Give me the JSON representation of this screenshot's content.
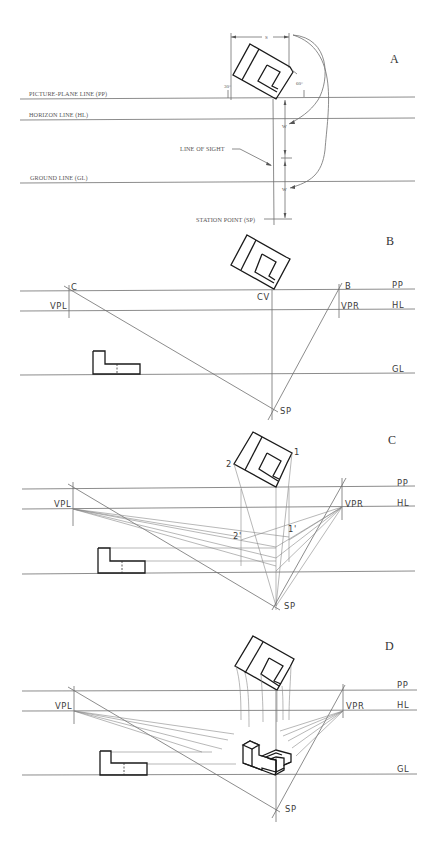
{
  "figure": {
    "panels": [
      {
        "id": "A",
        "label": "A",
        "line_labels": {
          "pp": "PICTURE-PLANE LINE (PP)",
          "hl": "HORIZON LINE (HL)",
          "gl": "GROUND LINE (GL)",
          "sp": "STATION POINT (SP)",
          "los": "LINE OF SIGHT"
        },
        "dimensions": {
          "width": "S",
          "distance_1": "W",
          "distance_2": "W"
        },
        "angles": {
          "left": "30°",
          "right": "60°"
        }
      },
      {
        "id": "B",
        "label": "B",
        "point_labels": {
          "c": "C",
          "b": "B",
          "cv": "CV",
          "vpl": "VPL",
          "vpr": "VPR",
          "sp": "SP"
        },
        "line_labels": {
          "pp": "PP",
          "hl": "HL",
          "gl": "GL"
        }
      },
      {
        "id": "C",
        "label": "C",
        "point_labels": {
          "p1": "1",
          "p2": "2",
          "p1p": "1'",
          "p2p": "2'",
          "vpl": "VPL",
          "vpr": "VPR",
          "sp": "SP"
        },
        "line_labels": {
          "pp": "PP",
          "hl": "HL"
        }
      },
      {
        "id": "D",
        "label": "D",
        "point_labels": {
          "vpl": "VPL",
          "vpr": "VPR",
          "sp": "SP"
        },
        "line_labels": {
          "pp": "PP",
          "hl": "HL",
          "gl": "GL"
        }
      }
    ]
  }
}
